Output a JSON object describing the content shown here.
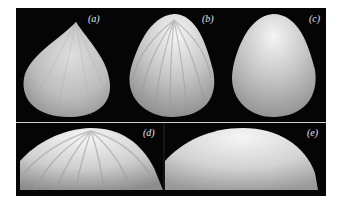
{
  "figure": {
    "panels": [
      {
        "id": "a",
        "label": "(a)",
        "description": "cone-like shape with sharp apex, faceted shading"
      },
      {
        "id": "b",
        "label": "(b)",
        "description": "rounded apex shape with visible radial streak artifacts"
      },
      {
        "id": "c",
        "label": "(c)",
        "description": "rounded apex shape with smooth shading"
      },
      {
        "id": "d",
        "label": "(d)",
        "description": "close-up of top of shape (b) showing streak artifacts"
      },
      {
        "id": "e",
        "label": "(e)",
        "description": "close-up of top of shape (c) with smooth shading"
      }
    ],
    "colors": {
      "background": "#060606",
      "surface_light": "#f2f2f2",
      "surface_mid": "#bdbdbd",
      "surface_dark": "#8a8a8a",
      "divider": "#cfcfcf"
    }
  }
}
